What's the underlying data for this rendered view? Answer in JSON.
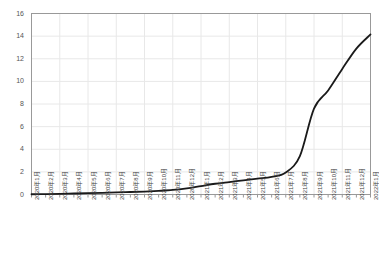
{
  "chart_data": {
    "type": "line",
    "title": "",
    "subtitle": "",
    "xlabel": "",
    "ylabel": "",
    "grid": true,
    "legend": null,
    "legend_position": "none",
    "ylim": [
      0,
      16
    ],
    "ytick_step": 2,
    "yticks": [
      0,
      2,
      4,
      6,
      8,
      10,
      12,
      14,
      16
    ],
    "ytick_labels": [
      "0",
      "2",
      "4",
      "6",
      "8",
      "10",
      "12",
      "14",
      "16"
    ],
    "categories": [
      "2020年1月",
      "2020年2月",
      "2020年3月",
      "2020年4月",
      "2020年5月",
      "2020年6月",
      "2020年7月",
      "2020年8月",
      "2020年9月",
      "2020年10月",
      "2020年11月",
      "2020年12月",
      "2021年1月",
      "2021年2月",
      "2021年3月",
      "2021年4月",
      "2021年5月",
      "2021年6月",
      "2021年7月",
      "2021年8月",
      "2021年9月",
      "2021年10月",
      "2021年11月",
      "2021年12月",
      "2022年1月"
    ],
    "series": [
      {
        "name": "cumulative",
        "color": "#1a1a1a",
        "line_width": 1.8,
        "values": [
          0.02,
          0.04,
          0.06,
          0.09,
          0.12,
          0.15,
          0.18,
          0.22,
          0.26,
          0.32,
          0.4,
          0.55,
          0.75,
          0.95,
          1.1,
          1.25,
          1.4,
          1.55,
          1.95,
          3.4,
          7.6,
          9.2,
          11.1,
          12.9,
          14.15
        ]
      }
    ],
    "colors": {
      "line": "#1a1a1a",
      "axis": "#999999",
      "grid": "#e8e8e8",
      "tick_text": "#555555",
      "background": "#ffffff"
    }
  }
}
